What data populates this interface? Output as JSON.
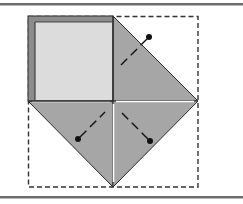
{
  "diagram": {
    "type": "origami-folding-step",
    "colors": {
      "background": "#ffffff",
      "rule": "#6e6e6e",
      "flap_fill": "#a6a6a6",
      "light_fill": "#dcdcdc",
      "border_strip": "#8c8c8c",
      "outline": "#2a2a2a",
      "dashed": "#333333",
      "dot": "#111111"
    },
    "dashed_square": {
      "x": 28,
      "y": 16,
      "width": 170,
      "height": 171
    },
    "center": {
      "x": 113,
      "y": 101
    },
    "flaps": [
      {
        "id": "top-left-square",
        "shape": "square",
        "fill": "light"
      },
      {
        "id": "top-right-triangle",
        "shape": "triangle",
        "fill": "gray"
      },
      {
        "id": "bottom-left-triangle",
        "shape": "triangle",
        "fill": "gray"
      },
      {
        "id": "bottom-right-triangle",
        "shape": "triangle",
        "fill": "gray"
      }
    ],
    "fold_markers": [
      {
        "dot": [
          149,
          37
        ],
        "line_to": [
          123,
          63
        ]
      },
      {
        "dot": [
          78,
          139
        ],
        "line_to": [
          104,
          113
        ]
      },
      {
        "dot": [
          150,
          141
        ],
        "line_to": [
          124,
          115
        ]
      }
    ]
  }
}
